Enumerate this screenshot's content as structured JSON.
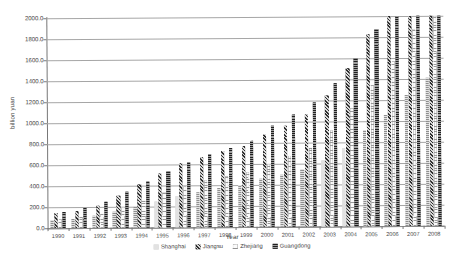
{
  "chart_data": {
    "type": "bar",
    "title": "",
    "xlabel": "Year",
    "ylabel": "billion yuan",
    "ylim": [
      0,
      2000
    ],
    "ytick_step": 200,
    "grid": true,
    "legend_position": "bottom",
    "categories": [
      "1990",
      "1991",
      "1992",
      "1993",
      "1994",
      "1995",
      "1996",
      "1997",
      "1998",
      "1999",
      "2000",
      "2001",
      "2002",
      "2003",
      "2004",
      "2005",
      "2006",
      "2007",
      "2008"
    ],
    "ytick_labels": [
      "0.0",
      "200.0",
      "400.0",
      "600.0",
      "800.0",
      "1000.0",
      "1200.0",
      "1400.0",
      "1600.0",
      "1800.0",
      "2000.0"
    ],
    "series": [
      {
        "name": "Shanghai",
        "pattern": "light-horizontal-hatch",
        "color": "#d2d2d2",
        "values": [
          75.7,
          89.4,
          111.4,
          151.9,
          198.5,
          246.3,
          295.7,
          336.0,
          368.8,
          403.5,
          455.1,
          495.1,
          540.9,
          625.1,
          745.0,
          915.4,
          1057.2,
          1249.4,
          1406.9
        ]
      },
      {
        "name": "Jiangsu",
        "pattern": "dark-diagonal-hatch",
        "color": "#6e6e6e",
        "values": [
          141.6,
          164.2,
          212.0,
          308.8,
          414.1,
          515.5,
          605.4,
          668.0,
          728.0,
          776.0,
          877.4,
          962.0,
          1063.2,
          1246.0,
          1506.0,
          1830.0,
          2159.0,
          2558.0,
          3000.0
        ]
      },
      {
        "name": "Zhejiang",
        "pattern": "light-vertical-hatch",
        "color": "#f2f2f2",
        "values": [
          90.4,
          104.9,
          133.6,
          189.3,
          256.7,
          335.0,
          394.1,
          447.0,
          484.1,
          522.6,
          603.6,
          673.5,
          748.0,
          912.0,
          1124.3,
          1341.8,
          1571.8,
          1872.0,
          2149.0
        ]
      },
      {
        "name": "Guangdong",
        "pattern": "dark-horizontal-stripe",
        "color": "#4a4a4a",
        "values": [
          155.9,
          189.4,
          244.7,
          342.7,
          442.0,
          538.2,
          615.9,
          691.9,
          754.1,
          815.9,
          966.2,
          1063.5,
          1177.0,
          1358.2,
          1603.9,
          1872.2,
          2233.0,
          2575.0,
          2958.0
        ]
      }
    ],
    "series_display_scale_note": "values plotted on 0-2000 axis"
  },
  "legend": {
    "items": [
      {
        "label": "Shanghai"
      },
      {
        "label": "Jiangsu"
      },
      {
        "label": "Zhejiang"
      },
      {
        "label": "Guangdong"
      }
    ]
  }
}
